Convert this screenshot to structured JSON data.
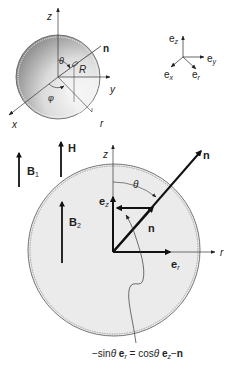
{
  "figure": {
    "top_sphere": {
      "axes": {
        "z": "z",
        "y": "y",
        "x": "x",
        "r": "r"
      },
      "normal_label": "n",
      "radius_label": "R",
      "polar_angle": "θ",
      "azimuth_angle": "φ"
    },
    "basis_frame": {
      "ez_base": "e",
      "ez_sub": "z",
      "ey_base": "e",
      "ey_sub": "y",
      "ex_base": "e",
      "ex_sub": "x",
      "er_base": "e",
      "er_sub": "r"
    },
    "fields": {
      "B1_base": "B",
      "B1_sub": "1",
      "H": "H",
      "B2_base": "B",
      "B2_sub": "2"
    },
    "main_section": {
      "z_axis": "z",
      "r_axis": "r",
      "n_outer": "n",
      "n_inner": "n",
      "theta": "θ",
      "ez_base": "e",
      "ez_sub": "z",
      "er_base": "e",
      "er_sub": "r"
    },
    "equation": {
      "lhs_prefix": "−sin",
      "lhs_theta": "θ",
      "lhs_vec": "e",
      "lhs_sub": "r",
      "equals": " = ",
      "rhs_cos": "cos",
      "rhs_theta": "θ",
      "rhs_vec": "e",
      "rhs_sub": "z",
      "rhs_minus": "−",
      "rhs_n": "n"
    },
    "colors": {
      "sphere_dark": "#7a7a7a",
      "sphere_light": "#f2f2f2",
      "section_fill": "#ebebeb",
      "ink": "#111111"
    }
  }
}
